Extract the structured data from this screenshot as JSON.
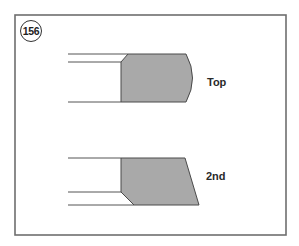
{
  "figure": {
    "number": "156",
    "rings": [
      {
        "label": "Top",
        "profile": "barrel-face"
      },
      {
        "label": "2nd",
        "profile": "taper-face"
      }
    ]
  },
  "colors": {
    "ring_fill": "#a9a9a9",
    "line": "#555555",
    "frame": "#6e6e6e"
  }
}
